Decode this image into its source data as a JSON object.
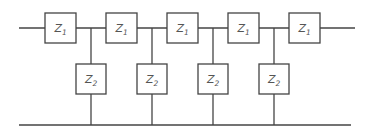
{
  "diagram": {
    "type": "ladder-network",
    "colors": {
      "line": "#444444",
      "text": "#555555",
      "background": "#ffffff"
    },
    "series_impedances": [
      {
        "label": "Z",
        "sub": "1",
        "x": 45
      },
      {
        "label": "Z",
        "sub": "1",
        "x": 106
      },
      {
        "label": "Z",
        "sub": "1",
        "x": 167
      },
      {
        "label": "Z",
        "sub": "1",
        "x": 228
      },
      {
        "label": "Z",
        "sub": "1",
        "x": 289
      }
    ],
    "shunt_impedances": [
      {
        "label": "Z",
        "sub": "2",
        "x": 91
      },
      {
        "label": "Z",
        "sub": "2",
        "x": 152
      },
      {
        "label": "Z",
        "sub": "2",
        "x": 213
      },
      {
        "label": "Z",
        "sub": "2",
        "x": 274
      }
    ]
  }
}
